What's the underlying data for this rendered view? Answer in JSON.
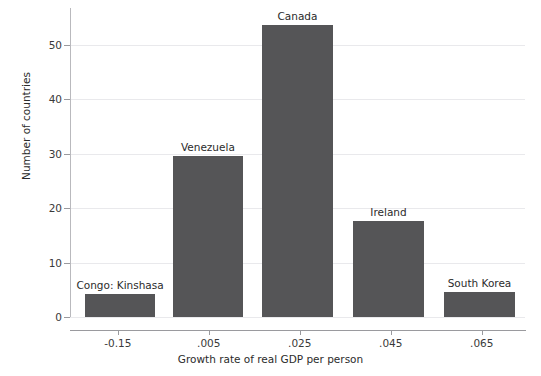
{
  "figure": {
    "clipped_header_text": "",
    "background_color": "#ffffff",
    "bar_color": "#555557",
    "grid_color": "#e9e9ec"
  },
  "chart_data": {
    "type": "bar",
    "title": "",
    "xlabel": "Growth rate of real GDP per person",
    "ylabel": "Number of countries",
    "categories": [
      "-0.005",
      "0.005",
      "0.015",
      "0.025",
      "0.035",
      "0.045",
      "0.055",
      "0.065"
    ],
    "bars": [
      {
        "label": "Congo: Kinshasa",
        "value": 4.2,
        "center": -0.0145,
        "width": 0.0155
      },
      {
        "label": "Venezuela",
        "value": 29.6,
        "center": 0.0048,
        "width": 0.0155
      },
      {
        "label": "Canada",
        "value": 53.6,
        "center": 0.0245,
        "width": 0.0155
      },
      {
        "label": "Ireland",
        "value": 17.6,
        "center": 0.0445,
        "width": 0.0155
      },
      {
        "label": "South Korea",
        "value": 4.5,
        "center": 0.0645,
        "width": 0.0155
      }
    ],
    "xticks": [
      {
        "label": "-0.15",
        "value": -0.015
      },
      {
        "label": ".005",
        "value": 0.005
      },
      {
        "label": ".025",
        "value": 0.025
      },
      {
        "label": ".045",
        "value": 0.045
      },
      {
        "label": ".065",
        "value": 0.065
      }
    ],
    "yticks": [
      {
        "label": "0",
        "value": 0
      },
      {
        "label": "10",
        "value": 10
      },
      {
        "label": "20",
        "value": 20
      },
      {
        "label": "30",
        "value": 30
      },
      {
        "label": "40",
        "value": 40
      },
      {
        "label": "50",
        "value": 50
      }
    ],
    "ylim": [
      0,
      56.7
    ],
    "xlim": [
      -0.0255,
      0.0745
    ],
    "grid": "horizontal",
    "legend": "none"
  }
}
